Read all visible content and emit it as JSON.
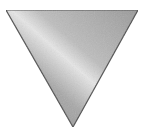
{
  "icon": {
    "name": "metallic-inverted-triangle",
    "shape": "triangle-down",
    "colors": {
      "edge": "#4a4a4a",
      "dark": "#8c8c8c",
      "mid": "#b4b4b4",
      "highlight": "#ececec",
      "background": "#ffffff"
    }
  }
}
